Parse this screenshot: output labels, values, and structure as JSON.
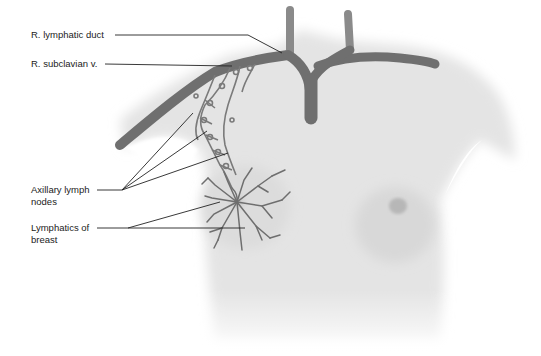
{
  "figure": {
    "labels": [
      {
        "id": "r-lymphatic-duct",
        "text": "R. lymphatic duct"
      },
      {
        "id": "r-subclavian-v",
        "text": "R. subclavian v."
      },
      {
        "id": "axillary-lymph-nodes",
        "text": "Axillary lymph\nnodes"
      },
      {
        "id": "lymphatics-of-breast",
        "text": "Lymphatics of\nbreast"
      }
    ],
    "colors": {
      "skin": "#e6e6e6",
      "skin_shadow": "#d2d2d2",
      "vein": "#6f6f6f",
      "lymphatic": "#7a7a7a",
      "leader_line": "#222222",
      "label_text": "#222222"
    }
  }
}
